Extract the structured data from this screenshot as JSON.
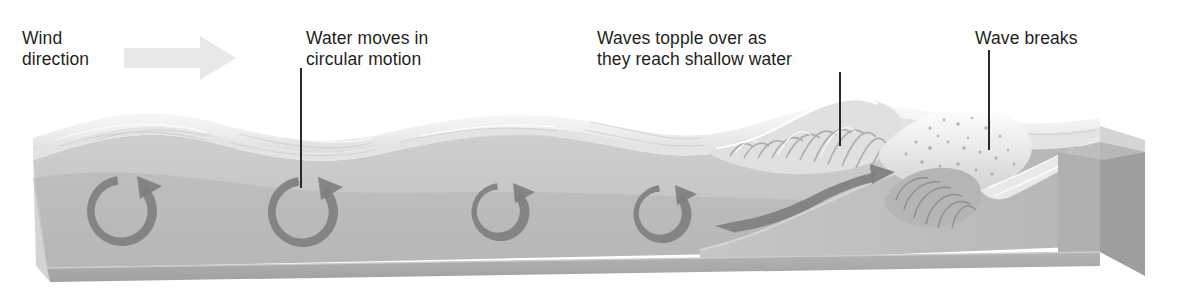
{
  "figure": {
    "background_color": "#ffffff",
    "text_color": "#231f20",
    "leader_color": "#2a2a2a",
    "water_surface_color": "#f2f2f2",
    "water_body_color": "#c3c3c3",
    "water_front_color": "#a8a8a8",
    "seabed_color": "#bdbdbd",
    "seabed_side_color": "#9c9c9c",
    "arrow_color": "#7d7d7d",
    "wind_arrow_color": "#e8e8e8"
  },
  "labels": [
    {
      "id": "wind-direction",
      "text": "Wind\ndirection",
      "x": 22,
      "y": 28,
      "align": "left",
      "has_leader": false
    },
    {
      "id": "circular-motion",
      "text": "Water moves in\ncircular motion",
      "x": 306,
      "y": 28,
      "align": "left",
      "has_leader": true,
      "leader": {
        "x": 300,
        "y_top": 68,
        "y_bottom": 188
      }
    },
    {
      "id": "waves-topple",
      "text": "Waves topple over as\nthey reach shallow water",
      "x": 597,
      "y": 28,
      "align": "left",
      "has_leader": true,
      "leader": {
        "x": 839,
        "y_top": 72,
        "y_bottom": 146
      }
    },
    {
      "id": "wave-breaks",
      "text": "Wave breaks",
      "x": 975,
      "y": 28,
      "align": "left",
      "has_leader": true,
      "leader": {
        "x": 988,
        "y_top": 50,
        "y_bottom": 150
      }
    }
  ],
  "wind_arrow": {
    "name": "wind-direction-arrow",
    "direction": "right",
    "x": 124,
    "y": 36,
    "width": 112,
    "height": 44,
    "color": "#e8e8e8"
  },
  "orbital_circles": [
    {
      "id": 1,
      "cx": 122,
      "cy": 211,
      "r": 35,
      "label": "circular orbital motion"
    },
    {
      "id": 2,
      "cx": 303,
      "cy": 212,
      "r": 35,
      "label": "circular orbital motion"
    },
    {
      "id": 3,
      "cx": 501,
      "cy": 212,
      "r": 29,
      "label": "circular orbital motion"
    },
    {
      "id": 4,
      "cx": 663,
      "cy": 214,
      "r": 29,
      "label": "circular orbital motion"
    }
  ],
  "forward_arrow": {
    "name": "forward-surge-arrow",
    "description": "curved arrow showing water surging forward up the slope",
    "color": "#808080"
  },
  "wave_crests": [
    {
      "x": 175,
      "height": "low"
    },
    {
      "x": 390,
      "height": "low"
    },
    {
      "x": 600,
      "height": "medium"
    },
    {
      "x": 790,
      "height": "high",
      "note": "steepening, toppling"
    },
    {
      "x": 960,
      "height": "breaking",
      "note": "breaking with foam"
    }
  ],
  "seabed": {
    "description": "sloping seafloor rising from deep at left to shallow beach at right",
    "shallow_start_x": 770
  }
}
